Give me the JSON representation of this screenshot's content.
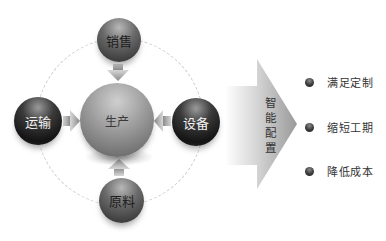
{
  "diagram": {
    "center": {
      "label": "生产"
    },
    "nodes": [
      {
        "id": "top",
        "label": "销售"
      },
      {
        "id": "left",
        "label": "运输"
      },
      {
        "id": "right",
        "label": "设备"
      },
      {
        "id": "bottom",
        "label": "原料"
      }
    ],
    "arrow": {
      "label_lines": [
        "智",
        "能",
        "配",
        "置"
      ]
    },
    "outcomes": [
      {
        "label": "满足定制"
      },
      {
        "label": "缩短工期"
      },
      {
        "label": "降低成本"
      }
    ]
  },
  "colors": {
    "background": "#ffffff",
    "ring": "#cfcfcf",
    "arrow_gradient_start": "#ffffff",
    "arrow_gradient_end": "#9a9a9a",
    "text": "#333333"
  }
}
